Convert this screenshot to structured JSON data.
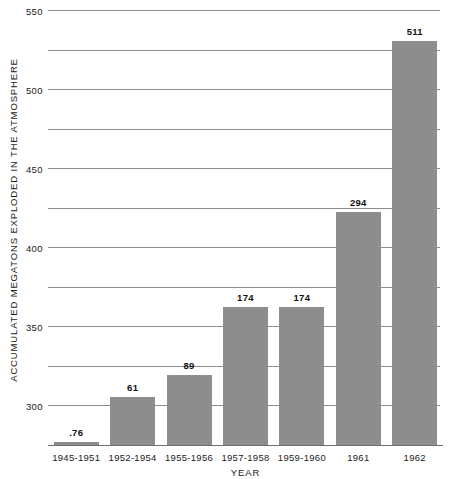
{
  "chart_data": {
    "type": "bar",
    "title": "",
    "subtitle": "",
    "xlabel": "YEAR",
    "ylabel": "ACCUMULATED MEGATONS EXPLODED IN THE ATMOSPHERE",
    "categories": [
      "1945-1951",
      "1952-1954",
      "1955-1956",
      "1957-1958",
      "1959-1960",
      "1961",
      "1962"
    ],
    "values": [
      0.76,
      61,
      89,
      174,
      174,
      294,
      511
    ],
    "value_labels": [
      ".76",
      "61",
      "89",
      "174",
      "174",
      "294",
      "511"
    ],
    "ylim": [
      0,
      550
    ],
    "ytick_labels": [
      "0",
      "50",
      "100",
      "150",
      "200",
      "250",
      "300",
      "350",
      "400",
      "450",
      "500",
      "550"
    ],
    "ytick_values": [
      0,
      50,
      100,
      150,
      200,
      250,
      300,
      350,
      400,
      450,
      500,
      550
    ],
    "grid": "horizontal",
    "legend": "none",
    "bar_color": "#8d8d8d",
    "grid_color": "#8c8c8c",
    "axis_color": "#6e6e6e",
    "background_color": "#ffffff"
  }
}
